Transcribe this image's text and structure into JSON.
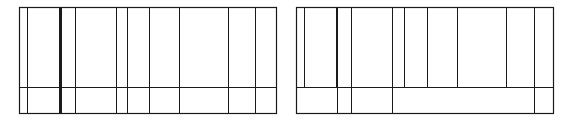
{
  "diagrams": [
    {
      "id": "left-grid",
      "frame": {
        "x": 19,
        "y": 7,
        "width": 257,
        "height": 106
      },
      "row_divider_y": 87,
      "line_color": "#1a1a1a",
      "top_row_verticals": [
        27,
        59,
        61,
        75,
        116,
        127,
        149,
        179,
        228,
        255
      ],
      "bottom_row_verticals": [
        27,
        59,
        61,
        75,
        116,
        127,
        149,
        179,
        228,
        255
      ],
      "thick_verticals": [
        59
      ]
    },
    {
      "id": "right-grid",
      "frame": {
        "x": 296,
        "y": 7,
        "width": 257,
        "height": 106
      },
      "row_divider_y": 87,
      "line_color": "#1a1a1a",
      "top_row_verticals": [
        304,
        336,
        337,
        351,
        392,
        404,
        427,
        457,
        506,
        534
      ],
      "bottom_row_verticals": [
        337,
        351,
        392,
        534
      ],
      "thick_verticals": [
        336
      ]
    }
  ]
}
